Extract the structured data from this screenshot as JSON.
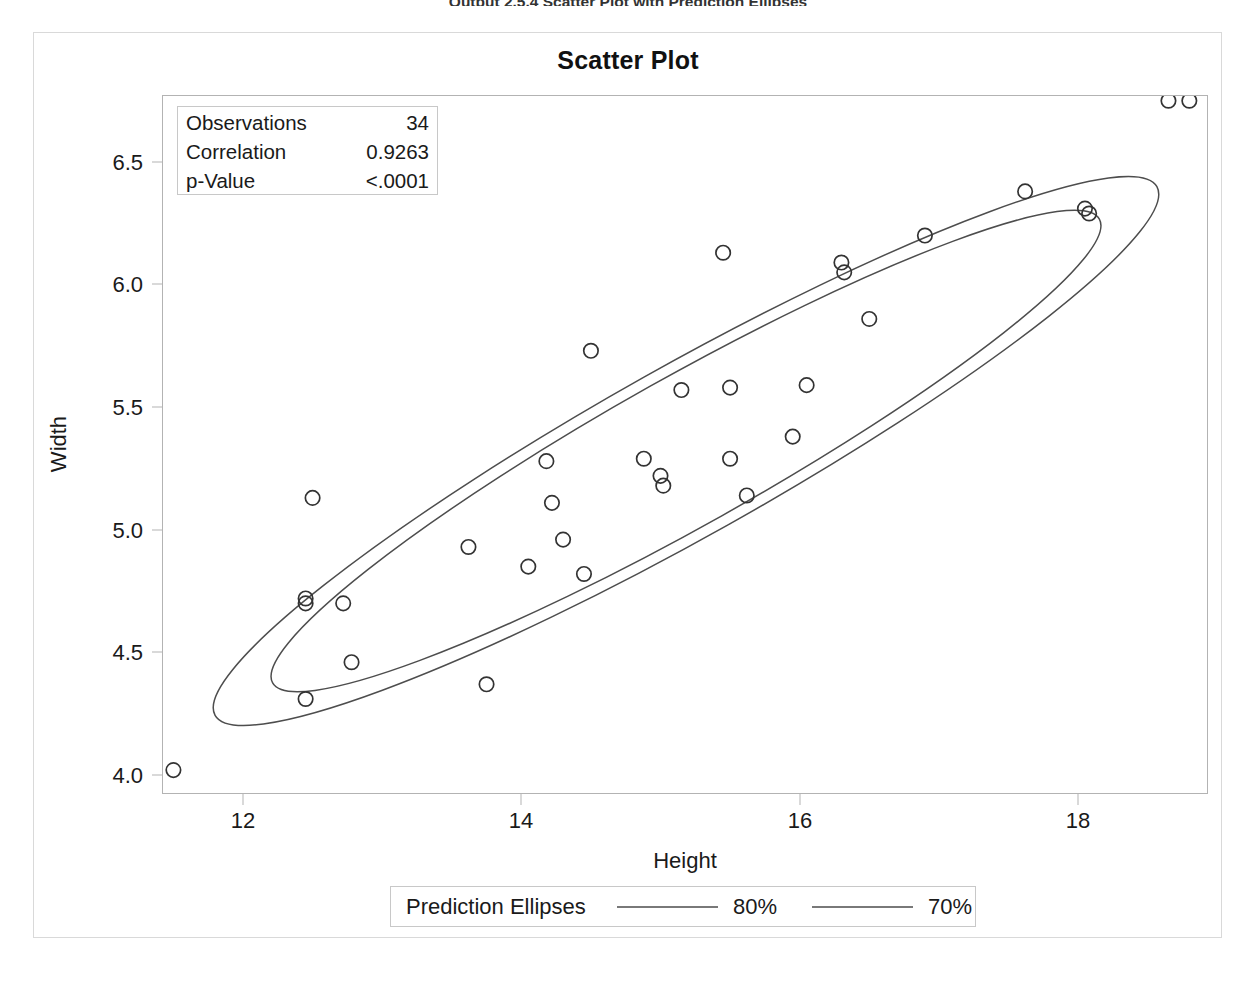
{
  "document": {
    "caption": "Output 2.5.4  Scatter Plot with Prediction Ellipses"
  },
  "chart_data": {
    "type": "scatter",
    "title": "Scatter Plot",
    "xlabel": "Height",
    "ylabel": "Width",
    "xlim": [
      11.35,
      19.15
    ],
    "ylim": [
      3.93,
      6.85
    ],
    "xticks": [
      "12",
      "14",
      "16",
      "18"
    ],
    "xtick_values": [
      12,
      14,
      16,
      18
    ],
    "yticks": [
      "4.0",
      "4.5",
      "5.0",
      "5.5",
      "6.0",
      "6.5"
    ],
    "ytick_values": [
      4.0,
      4.5,
      5.0,
      5.5,
      6.0,
      6.5
    ],
    "grid": false,
    "marker": "open-circle",
    "points": [
      [
        11.5,
        4.02
      ],
      [
        12.45,
        4.31
      ],
      [
        12.45,
        4.7
      ],
      [
        12.45,
        4.72
      ],
      [
        12.5,
        5.13
      ],
      [
        12.72,
        4.7
      ],
      [
        12.78,
        4.46
      ],
      [
        13.62,
        4.93
      ],
      [
        13.75,
        4.37
      ],
      [
        14.05,
        4.85
      ],
      [
        14.18,
        5.28
      ],
      [
        14.22,
        5.11
      ],
      [
        14.3,
        4.96
      ],
      [
        14.45,
        4.82
      ],
      [
        14.5,
        5.73
      ],
      [
        14.88,
        5.29
      ],
      [
        15.0,
        5.22
      ],
      [
        15.02,
        5.18
      ],
      [
        15.15,
        5.57
      ],
      [
        15.45,
        6.13
      ],
      [
        15.5,
        5.58
      ],
      [
        15.5,
        5.29
      ],
      [
        15.62,
        5.14
      ],
      [
        15.95,
        5.38
      ],
      [
        16.05,
        5.59
      ],
      [
        16.3,
        6.09
      ],
      [
        16.32,
        6.05
      ],
      [
        16.5,
        5.86
      ],
      [
        16.9,
        6.2
      ],
      [
        17.62,
        6.38
      ],
      [
        18.05,
        6.31
      ],
      [
        18.08,
        6.29
      ],
      [
        18.65,
        6.75
      ],
      [
        18.8,
        6.75
      ],
      [
        19.0,
        6.61
      ]
    ],
    "ellipses": [
      {
        "label": "80%",
        "level": 0.8
      },
      {
        "label": "70%",
        "level": 0.7
      }
    ],
    "statistics": {
      "rows": [
        {
          "label": "Observations",
          "value": "34"
        },
        {
          "label": "Correlation",
          "value": "0.9263"
        },
        {
          "label": "p-Value",
          "value": "<.0001"
        }
      ]
    },
    "legend": {
      "title": "Prediction Ellipses",
      "entries": [
        "80%",
        "70%"
      ]
    }
  },
  "colors": {
    "marker_stroke": "#333333",
    "ellipse_stroke": "#4d4d4d",
    "frame": "#b3b3b3",
    "text": "#1a1a1a"
  }
}
